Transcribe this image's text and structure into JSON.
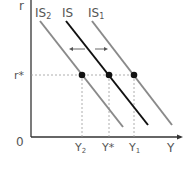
{
  "diagram": {
    "type": "IS curve shift",
    "axes": {
      "y_label": "r",
      "x_label": "Y",
      "origin_label": "0"
    },
    "curves": [
      {
        "name": "IS2",
        "label_main": "IS",
        "label_sub": "2",
        "color": "#8a8a8a"
      },
      {
        "name": "IS",
        "label_main": "IS",
        "label_sub": "",
        "color": "#111111"
      },
      {
        "name": "IS1",
        "label_main": "IS",
        "label_sub": "1",
        "color": "#8a8a8a"
      }
    ],
    "equilibrium_rate": {
      "label": "r*"
    },
    "output_levels": [
      {
        "label_main": "Y",
        "label_sub": "2"
      },
      {
        "label_main": "Y*",
        "label_sub": ""
      },
      {
        "label_main": "Y",
        "label_sub": "1"
      }
    ],
    "shift_arrows": [
      "left",
      "right"
    ]
  }
}
